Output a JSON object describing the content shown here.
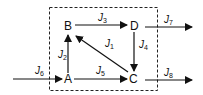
{
  "diagram": {
    "type": "flow-network",
    "boundary": "dashed-box",
    "nodes": [
      {
        "id": "A",
        "label": "A"
      },
      {
        "id": "B",
        "label": "B"
      },
      {
        "id": "C",
        "label": "C"
      },
      {
        "id": "D",
        "label": "D"
      }
    ],
    "edges": [
      {
        "id": "J1",
        "label": "J",
        "sub": "1",
        "from": "C",
        "to": "B"
      },
      {
        "id": "J2",
        "label": "J",
        "sub": "2",
        "from": "A",
        "to": "B"
      },
      {
        "id": "J3",
        "label": "J",
        "sub": "3",
        "from": "B",
        "to": "D"
      },
      {
        "id": "J4",
        "label": "J",
        "sub": "4",
        "from": "D",
        "to": "C"
      },
      {
        "id": "J5",
        "label": "J",
        "sub": "5",
        "from": "A",
        "to": "C"
      },
      {
        "id": "J6",
        "label": "J",
        "sub": "6",
        "from": "external",
        "to": "A"
      },
      {
        "id": "J7",
        "label": "J",
        "sub": "7",
        "from": "D",
        "to": "external"
      },
      {
        "id": "J8",
        "label": "J",
        "sub": "8",
        "from": "C",
        "to": "external"
      }
    ]
  }
}
